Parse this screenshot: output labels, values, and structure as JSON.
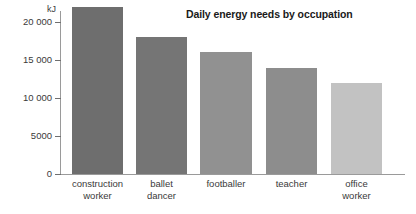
{
  "chart_data": {
    "type": "bar",
    "title": "Daily energy needs by occupation",
    "xlabel": "",
    "ylabel": "kJ",
    "categories": [
      "construction\nworker",
      "ballet\ndancer",
      "footballer",
      "teacher",
      "office\nworker"
    ],
    "values": [
      22000,
      18000,
      16000,
      14000,
      12000
    ],
    "ylim": [
      0,
      22500
    ],
    "yticks": [
      0,
      5000,
      10000,
      15000,
      20000
    ],
    "ytick_labels": [
      "0",
      "5000",
      "10 000",
      "15 000",
      "20 000"
    ],
    "grid": false,
    "legend": "none",
    "bar_colors": [
      "#6e6e6e",
      "#757575",
      "#919191",
      "#8d8d8d",
      "#c2c2c2"
    ],
    "axis_color": "#9a9a9a",
    "background": "#ffffff"
  },
  "axis": {
    "unit_label": "kJ"
  }
}
